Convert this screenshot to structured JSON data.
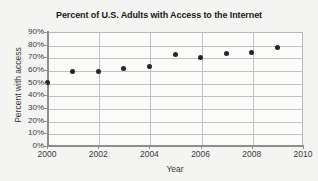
{
  "chart_data": {
    "type": "scatter",
    "title": "Percent of U.S. Adults with Access to the Internet",
    "xlabel": "Year",
    "ylabel": "Percent with access",
    "x": [
      2000,
      2001,
      2002,
      2003,
      2004,
      2005,
      2006,
      2007,
      2008,
      2009
    ],
    "values": [
      50,
      59,
      59,
      61,
      63,
      72,
      70,
      73,
      74,
      78
    ],
    "series": [
      {
        "name": "Percent with access",
        "points": [
          {
            "x": 2000,
            "y": 50
          },
          {
            "x": 2001,
            "y": 59
          },
          {
            "x": 2002,
            "y": 59
          },
          {
            "x": 2003,
            "y": 61
          },
          {
            "x": 2004,
            "y": 63
          },
          {
            "x": 2005,
            "y": 72
          },
          {
            "x": 2006,
            "y": 70
          },
          {
            "x": 2007,
            "y": 73
          },
          {
            "x": 2008,
            "y": 74
          },
          {
            "x": 2009,
            "y": 78
          }
        ]
      }
    ],
    "xlim": [
      2000,
      2010
    ],
    "ylim": [
      0,
      90
    ],
    "xticks": [
      2000,
      2002,
      2004,
      2006,
      2008,
      2010
    ],
    "xtick_labels": [
      "2000",
      "2002",
      "2004",
      "2006",
      "2008",
      "2010"
    ],
    "yticks": [
      0,
      10,
      20,
      30,
      40,
      50,
      60,
      70,
      80,
      90
    ],
    "ytick_labels": [
      "0%",
      "10%",
      "20%",
      "30%",
      "40%",
      "50%",
      "60%",
      "70%",
      "80%",
      "90%"
    ],
    "grid": true,
    "grid_axis": "both",
    "legend": "none",
    "marker": "circle",
    "marker_color": "#262626",
    "plot_background": "#fbfbfa",
    "page_background": "#f4f4f2",
    "grid_color": "#c2c2c2",
    "axis_color": "#8e8e8e"
  }
}
